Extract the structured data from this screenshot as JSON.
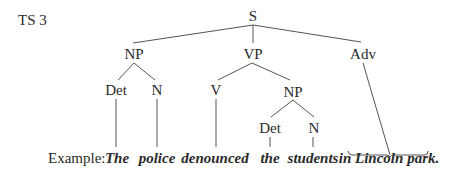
{
  "diagram": {
    "title": "TS 3",
    "example_label": "Example:",
    "nodes": {
      "s": "S",
      "np": "NP",
      "vp": "VP",
      "adv": "Adv",
      "det1": "Det",
      "n1": "N",
      "v": "V",
      "np2": "NP",
      "det2": "Det",
      "n2": "N"
    },
    "words": {
      "w1": "The",
      "w2": "police",
      "w3": "denounced",
      "w4": "the",
      "w5": "students",
      "w6": "in Lincoln park."
    },
    "edges": [
      [
        "S",
        "NP"
      ],
      [
        "S",
        "VP"
      ],
      [
        "S",
        "Adv"
      ],
      [
        "NP",
        "Det"
      ],
      [
        "NP",
        "N"
      ],
      [
        "VP",
        "V"
      ],
      [
        "VP",
        "NP"
      ],
      [
        "NP",
        "Det"
      ],
      [
        "NP",
        "N"
      ],
      [
        "Det",
        "The"
      ],
      [
        "N",
        "police"
      ],
      [
        "V",
        "denounced"
      ],
      [
        "Det",
        "the"
      ],
      [
        "N",
        "students"
      ],
      [
        "Adv",
        "in Lincoln park."
      ]
    ]
  }
}
